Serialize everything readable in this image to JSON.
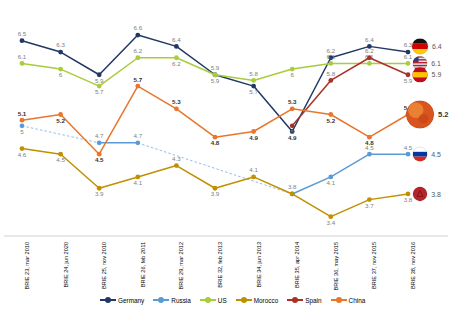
{
  "chart_data": {
    "type": "line",
    "title": "",
    "xlabel": "",
    "ylabel": "",
    "ylim": [
      3.2,
      6.9
    ],
    "grid": false,
    "legend_position": "bottom",
    "categories": [
      "BRIE 23, mar 2010",
      "BRIE 24, jun 2020",
      "BRIE 25, nov 2010",
      "BRIE 26, feb 2011",
      "BRIE 29, mar 2012",
      "BRIE 32, feb 2013",
      "BRIE 34, jun 2013",
      "BRIE 35, apr 2014",
      "BRIE 36, may 2015",
      "BRIE 37, nov 2015",
      "BRIE 38, nov 2016"
    ],
    "series": [
      {
        "name": "Germany",
        "color": "#1F3864",
        "values": [
          6.5,
          6.3,
          5.9,
          6.6,
          6.4,
          5.9,
          5.7,
          4.9,
          6.2,
          6.4,
          6.3
        ],
        "end_value": 6.4,
        "end_flag": "germany-flag-icon",
        "labels": [
          "6.5",
          "6.3",
          "5.9",
          "6.6",
          "6.4",
          "5.9",
          "5.7",
          "4.9",
          "6.2",
          "6.4",
          "6.3"
        ],
        "bold_labels": [
          "4.9"
        ]
      },
      {
        "name": "Russia",
        "color": "#5B9BD5",
        "values": [
          5.0,
          null,
          4.7,
          4.7,
          null,
          null,
          null,
          3.8,
          4.1,
          4.5,
          4.5
        ],
        "end_value": 4.5,
        "end_flag": "russia-flag-icon",
        "labels": [
          "5",
          "",
          "4.7",
          "4.7",
          "",
          "",
          "",
          "3.8",
          "4.1",
          "4.5",
          "4.5"
        ],
        "bold_labels": [],
        "dashed_connector": true
      },
      {
        "name": "US",
        "color": "#A9CC3B",
        "values": [
          6.1,
          6.0,
          5.7,
          6.2,
          6.2,
          5.9,
          5.8,
          6.0,
          6.1,
          6.1,
          6.1
        ],
        "end_value": 6.1,
        "end_flag": "us-flag-icon",
        "labels": [
          "6.1",
          "6",
          "5.7",
          "6.2",
          "6.2",
          "5.9",
          "5.8",
          "6",
          "6.1",
          "6.1",
          "6.1"
        ],
        "bold_labels": []
      },
      {
        "name": "Morocco",
        "color": "#BF9000",
        "values": [
          4.6,
          4.5,
          3.9,
          4.1,
          4.3,
          3.9,
          4.1,
          3.8,
          3.4,
          3.7,
          3.8
        ],
        "end_value": 3.8,
        "end_flag": "morocco-flag-icon",
        "labels": [
          "4.6",
          "4.5",
          "3.9",
          "4.1",
          "4.3",
          "3.9",
          "4.1",
          "",
          "3.4",
          "3.7",
          "3.8"
        ],
        "bold_labels": [],
        "dashed_connector": true
      },
      {
        "name": "Spain",
        "color": "#A93226",
        "values": [
          null,
          null,
          null,
          null,
          null,
          null,
          null,
          5.0,
          5.8,
          6.2,
          5.9
        ],
        "end_value": 5.9,
        "end_flag": "spain-flag-icon",
        "labels": [
          "",
          "",
          "",
          "",
          "",
          "",
          "",
          "5",
          "5.8",
          "6.2",
          "5.9"
        ],
        "bold_labels": []
      },
      {
        "name": "China",
        "color": "#E8762C",
        "values": [
          5.1,
          5.2,
          4.5,
          5.7,
          5.3,
          4.8,
          4.9,
          5.3,
          5.2,
          4.8,
          5.2
        ],
        "end_value": 5.2,
        "end_flag": "china-flag-icon",
        "labels": [
          "5.1",
          "5.2",
          "4.5",
          "5.7",
          "5.3",
          "4.8",
          "4.9",
          "5.3",
          "5.2",
          "4.8",
          "5.2"
        ],
        "bold_labels": [
          "5.1",
          "5.2",
          "4.5",
          "5.7",
          "5.3",
          "4.8",
          "4.9",
          "5.3",
          "5.2",
          "4.8",
          "5.2"
        ]
      }
    ]
  },
  "legend": {
    "items": [
      {
        "label": "Germany",
        "color": "#1F3864"
      },
      {
        "label": "Russia",
        "color": "#5B9BD5"
      },
      {
        "label": "US",
        "color": "#A9CC3B"
      },
      {
        "label": "Morocco",
        "color": "#BF9000"
      },
      {
        "label": "Spain",
        "color": "#A93226"
      },
      {
        "label": "China",
        "color": "#E8762C"
      }
    ]
  },
  "end_markers": [
    {
      "name": "Germany",
      "value": "6.4",
      "flag": "germany-flag-icon",
      "bold": false
    },
    {
      "name": "US",
      "value": "6.1",
      "flag": "us-flag-icon",
      "bold": false
    },
    {
      "name": "Spain",
      "value": "5.9",
      "flag": "spain-flag-icon",
      "bold": false
    },
    {
      "name": "China",
      "value": "5.2",
      "flag": "china-flag-icon",
      "bold": true
    },
    {
      "name": "Russia",
      "value": "4.5",
      "flag": "russia-flag-icon",
      "bold": false
    },
    {
      "name": "Morocco",
      "value": "3.8",
      "flag": "morocco-flag-icon",
      "bold": false
    }
  ]
}
